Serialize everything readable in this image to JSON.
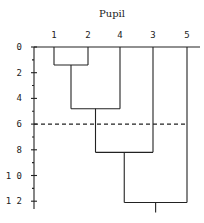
{
  "title": "Pupil",
  "leaves": [
    {
      "label": "1",
      "x": 54
    },
    {
      "label": "2",
      "x": 88
    },
    {
      "label": "4",
      "x": 120
    },
    {
      "label": "3",
      "x": 153
    },
    {
      "label": "5",
      "x": 187
    }
  ],
  "y_axis": {
    "ticks": [
      {
        "label": "0",
        "value": 0
      },
      {
        "label": "2",
        "value": 2
      },
      {
        "label": "4",
        "value": 4
      },
      {
        "label": "6",
        "value": 6
      },
      {
        "label": "8",
        "value": 8
      },
      {
        "label": "1 0",
        "value": 10
      },
      {
        "label": "1 2",
        "value": 12
      }
    ],
    "minor_ticks": [
      1,
      3,
      5,
      7,
      9,
      11
    ],
    "range": [
      0,
      12.5
    ]
  },
  "merges": [
    {
      "left": "1",
      "right": "2",
      "height": 1.4
    },
    {
      "left": "1,2",
      "right": "4",
      "height": 4.8
    },
    {
      "left": "1,2,4",
      "right": "3",
      "height": 8.2
    },
    {
      "left": "1,2,4,3",
      "right": "5",
      "height": 12.1
    }
  ],
  "cut_line": {
    "height": 6,
    "style": "dashed"
  }
}
